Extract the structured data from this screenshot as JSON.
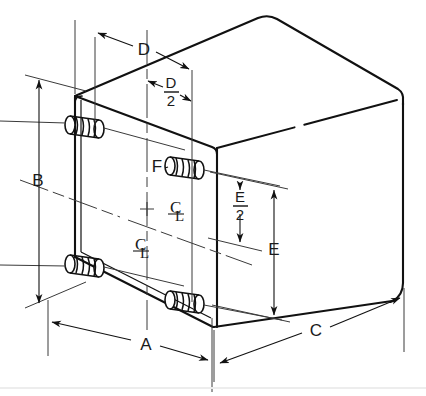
{
  "drawing": {
    "title": "Isometric dimensioned enclosure with mounting studs",
    "object_type": "rectangular enclosure / transformer case",
    "background_color": "#ffffff",
    "line_color": "#111111",
    "thin_line_color": "#3a3a3a",
    "dimensions": [
      {
        "id": "A",
        "label": "A",
        "meaning": "overall width of front face, measured along lower front edge",
        "placement": "bottom-left diagonal dimension line",
        "label_x": 146,
        "label_y": 345
      },
      {
        "id": "B",
        "label": "B",
        "meaning": "overall height of front face",
        "placement": "left vertical dimension line",
        "label_x": 37,
        "label_y": 180
      },
      {
        "id": "C",
        "label": "C",
        "meaning": "overall depth of enclosure",
        "placement": "bottom-right diagonal dimension line",
        "label_x": 316,
        "label_y": 330
      },
      {
        "id": "D",
        "label": "D",
        "meaning": "stud spacing across width (center to center)",
        "placement": "top diagonal dimension line",
        "label_x": 144,
        "label_y": 49
      },
      {
        "id": "D2",
        "label": "D",
        "denominator": "2",
        "is_fraction": true,
        "meaning": "half of stud spacing D, from centerline to stud",
        "placement": "upper inner diagonal dimension line",
        "label_x": 167,
        "label_y": 88
      },
      {
        "id": "E",
        "label": "E",
        "meaning": "stud spacing vertically (center to center)",
        "placement": "right vertical dimension line",
        "label_x": 273,
        "label_y": 248
      },
      {
        "id": "E2",
        "label": "E",
        "denominator": "2",
        "is_fraction": true,
        "meaning": "half of stud spacing E, from centerline to stud",
        "placement": "inner right vertical dimension line",
        "label_x": 239,
        "label_y": 200
      },
      {
        "id": "F",
        "label": "F",
        "meaning": "threaded mounting stud callout",
        "placement": "leader pointing to upper-right stud",
        "label_x": 157,
        "label_y": 172
      }
    ],
    "centerline_marks": [
      {
        "id": "cl-horizontal",
        "symbol": "CL",
        "meaning": "horizontal centerline symbol",
        "label_x": 176,
        "label_y": 209
      },
      {
        "id": "cl-vertical",
        "symbol": "CL",
        "meaning": "vertical centerline symbol",
        "label_x": 141,
        "label_y": 247
      }
    ],
    "studs": [
      {
        "id": "stud-top-left",
        "position": "upper left of front face",
        "cx": 88,
        "cy": 125
      },
      {
        "id": "stud-top-right",
        "position": "upper right of front face",
        "cx": 187,
        "cy": 166
      },
      {
        "id": "stud-bottom-left",
        "position": "lower left of front face",
        "cx": 88,
        "cy": 265
      },
      {
        "id": "stud-bottom-right",
        "position": "lower right of front face",
        "cx": 187,
        "cy": 300
      }
    ]
  }
}
